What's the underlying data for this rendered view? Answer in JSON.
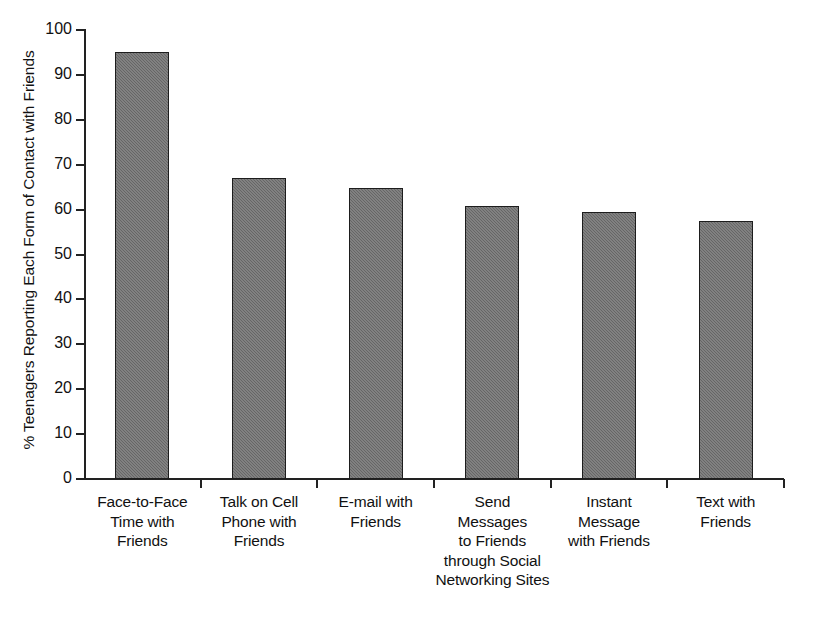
{
  "chart_data": {
    "type": "bar",
    "title": "",
    "xlabel": "",
    "ylabel": "% Teenagers Reporting Each Form of Contact with Friends",
    "ylim": [
      0,
      100
    ],
    "ytick_step": 10,
    "grid": false,
    "legend": null,
    "bar_color": "#6f6f6f",
    "bar_edge_color": "#1d1d1d",
    "categories": [
      "Face-to-Face Time with Friends",
      "Talk on Cell Phone with Friends",
      "E-mail with Friends",
      "Send Messages to Friends through Social Networking Sites",
      "Instant Message with Friends",
      "Text with Friends"
    ],
    "values": [
      95,
      67,
      64.8,
      60.8,
      59.5,
      57.4
    ],
    "yticks": [
      0,
      10,
      20,
      30,
      40,
      50,
      60,
      70,
      80,
      90,
      100
    ],
    "ytick_labels": [
      "0",
      "10",
      "20",
      "30",
      "40",
      "50",
      "60",
      "70",
      "80",
      "90",
      "100"
    ],
    "category_lines": [
      [
        "Face-to-Face",
        "Time with",
        "Friends"
      ],
      [
        "Talk on Cell",
        "Phone with",
        "Friends"
      ],
      [
        "E-mail with",
        "Friends"
      ],
      [
        "Send",
        "Messages",
        "to Friends",
        "through Social",
        "Networking Sites"
      ],
      [
        "Instant",
        "Message",
        "with Friends"
      ],
      [
        "Text with",
        "Friends"
      ]
    ]
  }
}
